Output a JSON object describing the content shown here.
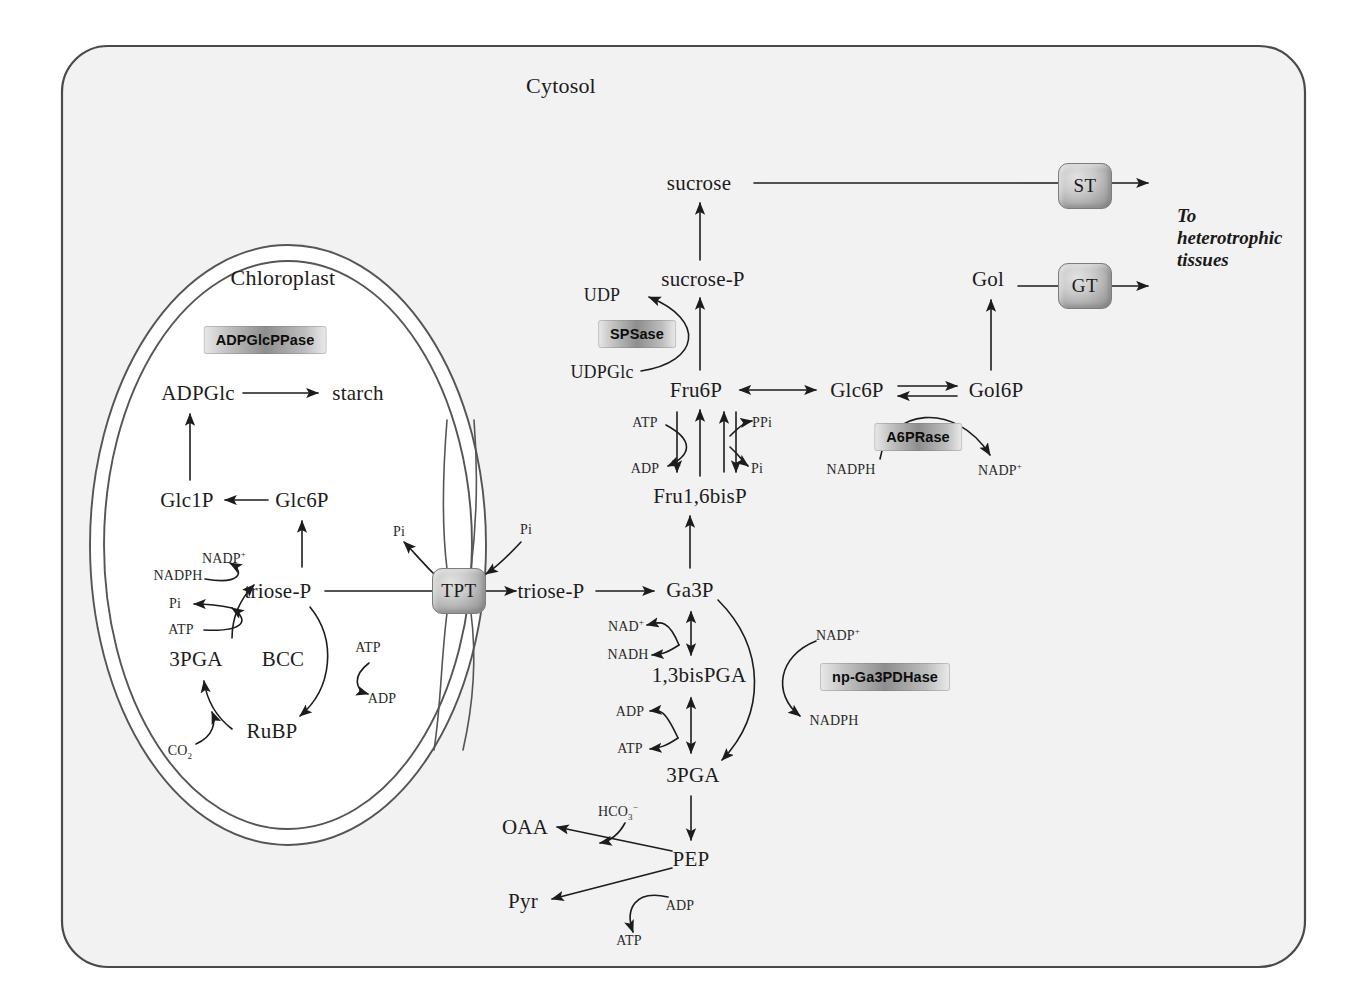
{
  "diagram": {
    "compartments": {
      "cytosol": "Cytosol",
      "chloroplast": "Chloroplast"
    },
    "external_label": "To heterotrophic tissues"
  },
  "colors": {
    "cell_fill": "#f2f2f2",
    "cell_stroke": "#4a4a4a",
    "chloroplast_stroke": "#555555",
    "arrow": "#1c1c1c",
    "enzyme_box_mid": "#8e8e8e",
    "transporter_face": "#c9c9c9",
    "text": "#1c1c1c"
  },
  "chloroplast_metabolites": [
    {
      "id": "adpglc",
      "label": "ADPGlc",
      "x": 198,
      "y": 393
    },
    {
      "id": "starch",
      "label": "starch",
      "x": 358,
      "y": 393
    },
    {
      "id": "glc1p",
      "label": "Glc1P",
      "x": 187,
      "y": 500
    },
    {
      "id": "glc6p_cp",
      "label": "Glc6P",
      "x": 302,
      "y": 500
    },
    {
      "id": "triosep_cp",
      "label": "triose-P",
      "x": 278,
      "y": 591
    },
    {
      "id": "3pga_cp",
      "label": "3PGA",
      "x": 196,
      "y": 659
    },
    {
      "id": "bcc",
      "label": "BCC",
      "x": 283,
      "y": 659
    },
    {
      "id": "rubp",
      "label": "RuBP",
      "x": 272,
      "y": 731
    }
  ],
  "cytosol_metabolites": [
    {
      "id": "sucrose",
      "label": "sucrose",
      "x": 699,
      "y": 183
    },
    {
      "id": "sucrose_p",
      "label": "sucrose-P",
      "x": 703,
      "y": 279
    },
    {
      "id": "udp",
      "label": "UDP",
      "x": 602,
      "y": 295
    },
    {
      "id": "udpglc",
      "label": "UDPGlc",
      "x": 602,
      "y": 372
    },
    {
      "id": "fru6p",
      "label": "Fru6P",
      "x": 696,
      "y": 390
    },
    {
      "id": "glc6p_cyt",
      "label": "Glc6P",
      "x": 857,
      "y": 390
    },
    {
      "id": "gol6p",
      "label": "Gol6P",
      "x": 996,
      "y": 390
    },
    {
      "id": "gol",
      "label": "Gol",
      "x": 988,
      "y": 279
    },
    {
      "id": "fru16bisp",
      "label": "Fru1,6bisP",
      "x": 700,
      "y": 496
    },
    {
      "id": "triosep_cyt",
      "label": "triose-P",
      "x": 551,
      "y": 591
    },
    {
      "id": "ga3p",
      "label": "Ga3P",
      "x": 690,
      "y": 590
    },
    {
      "id": "bispga",
      "label": "1,3bisPGA",
      "x": 699,
      "y": 675
    },
    {
      "id": "3pga_cyt",
      "label": "3PGA",
      "x": 693,
      "y": 775
    },
    {
      "id": "pep",
      "label": "PEP",
      "x": 691,
      "y": 859
    },
    {
      "id": "oaa",
      "label": "OAA",
      "x": 525,
      "y": 827
    },
    {
      "id": "pyr",
      "label": "Pyr",
      "x": 523,
      "y": 901
    }
  ],
  "cofactors": [
    {
      "id": "cp-nadph",
      "label": "NADPH",
      "x": 178,
      "y": 576,
      "sup": ""
    },
    {
      "id": "cp-nadp",
      "label": "NADP",
      "x": 224,
      "y": 558,
      "sup": "+"
    },
    {
      "id": "cp-pi",
      "label": "Pi",
      "x": 175,
      "y": 604,
      "sup": ""
    },
    {
      "id": "cp-atp",
      "label": "ATP",
      "x": 181,
      "y": 630,
      "sup": ""
    },
    {
      "id": "cp-atp2",
      "label": "ATP",
      "x": 368,
      "y": 648,
      "sup": ""
    },
    {
      "id": "cp-adp2",
      "label": "ADP",
      "x": 382,
      "y": 699,
      "sup": ""
    },
    {
      "id": "cp-co2",
      "label": "CO",
      "x": 180,
      "y": 752,
      "sub": "2"
    },
    {
      "id": "pi-left",
      "label": "Pi",
      "x": 399,
      "y": 532,
      "sup": ""
    },
    {
      "id": "pi-right",
      "label": "Pi",
      "x": 526,
      "y": 530,
      "sup": ""
    },
    {
      "id": "gly-atp",
      "label": "ATP",
      "x": 645,
      "y": 423,
      "sup": ""
    },
    {
      "id": "gly-adp",
      "label": "ADP",
      "x": 645,
      "y": 469,
      "sup": ""
    },
    {
      "id": "gly-ppi",
      "label": "PPi",
      "x": 762,
      "y": 423,
      "sup": ""
    },
    {
      "id": "gly-pi",
      "label": "Pi",
      "x": 757,
      "y": 469,
      "sup": ""
    },
    {
      "id": "a6p-nadph",
      "label": "NADPH",
      "x": 851,
      "y": 470,
      "sup": ""
    },
    {
      "id": "a6p-nadp",
      "label": "NADP",
      "x": 1000,
      "y": 470,
      "sup": "+"
    },
    {
      "id": "g3-nad",
      "label": "NAD",
      "x": 626,
      "y": 626,
      "sup": "+"
    },
    {
      "id": "g3-nadh",
      "label": "NADH",
      "x": 628,
      "y": 655,
      "sup": ""
    },
    {
      "id": "np-nadp",
      "label": "NADP",
      "x": 838,
      "y": 635,
      "sup": "+"
    },
    {
      "id": "np-nadph",
      "label": "NADPH",
      "x": 834,
      "y": 721,
      "sup": ""
    },
    {
      "id": "pga-adp",
      "label": "ADP",
      "x": 630,
      "y": 712,
      "sup": ""
    },
    {
      "id": "pga-atp",
      "label": "ATP",
      "x": 630,
      "y": 749,
      "sup": ""
    },
    {
      "id": "pep-hco3",
      "label": "HCO",
      "x": 618,
      "y": 812,
      "sub": "3",
      "sup2": "-"
    },
    {
      "id": "pep-adp",
      "label": "ADP",
      "x": 680,
      "y": 906,
      "sup": ""
    },
    {
      "id": "pep-atp",
      "label": "ATP",
      "x": 629,
      "y": 941,
      "sup": ""
    }
  ],
  "enzymes": [
    {
      "id": "adpglcppase",
      "label": "ADPGlcPPase",
      "x": 265,
      "y": 340
    },
    {
      "id": "spsase",
      "label": "SPSase",
      "x": 637,
      "y": 334
    },
    {
      "id": "a6prase",
      "label": "A6PRase",
      "x": 918,
      "y": 437
    },
    {
      "id": "npga3pdhase",
      "label": "np-Ga3PDHase",
      "x": 885,
      "y": 677
    }
  ],
  "transporters": [
    {
      "id": "tpt",
      "label": "TPT",
      "x": 459,
      "y": 591
    },
    {
      "id": "st",
      "label": "ST",
      "x": 1085,
      "y": 186
    },
    {
      "id": "gt",
      "label": "GT",
      "x": 1085,
      "y": 286
    }
  ]
}
